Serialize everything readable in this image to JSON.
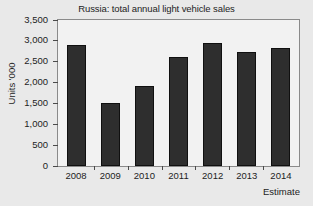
{
  "chart_data": {
    "type": "bar",
    "title": "Russia: total annual light vehicle sales",
    "xlabel": "",
    "ylabel": "Units '000",
    "categories": [
      "2008",
      "2009",
      "2010",
      "2011",
      "2012",
      "2013",
      "2014"
    ],
    "values": [
      2900,
      1510,
      1930,
      2620,
      2940,
      2730,
      2830
    ],
    "ylim": [
      0,
      3500
    ],
    "ytick_values": [
      0,
      500,
      1000,
      1500,
      2000,
      2500,
      3000,
      3500
    ],
    "ytick_labels": [
      "0",
      "500",
      "1,000",
      "1,500",
      "2,000",
      "2,500",
      "3,000",
      "3,500"
    ],
    "grid": false,
    "legend": null,
    "annotations": [
      {
        "text": "Estimate",
        "position": "bottom-right",
        "note": "2014 column is an estimate"
      }
    ],
    "series": [
      {
        "name": "Total annual light vehicle sales",
        "values": [
          2900,
          1510,
          1930,
          2620,
          2940,
          2730,
          2830
        ],
        "color": "#2e2e2e"
      }
    ]
  },
  "figure": {
    "background_color": "#e9e9e9",
    "plot_background_color": "#f2f2f2",
    "frame_color": "#8a8a8a",
    "bar_color": "#2e2e2e",
    "text_color": "#1d1d1d"
  }
}
